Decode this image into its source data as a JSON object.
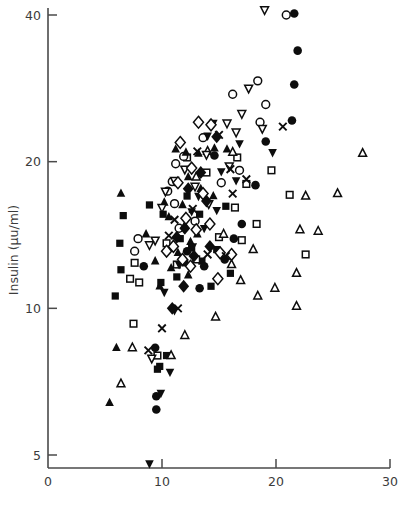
{
  "chart_data": {
    "type": "scatter",
    "title": "",
    "subtitle": "",
    "xlabel": "",
    "ylabel": "Insulin (μu/ml)",
    "xlim": [
      0,
      30
    ],
    "ylim": [
      4.3,
      44
    ],
    "yscale": "log",
    "xscale": "linear",
    "grid": false,
    "legend": "none",
    "xticks": [
      0,
      10,
      20,
      30
    ],
    "xtick_labels": [
      "0",
      "10",
      "20",
      "30"
    ],
    "yticks": [
      5,
      10,
      20,
      40
    ],
    "ytick_labels": [
      "5",
      "10",
      "20",
      "40"
    ],
    "marker_styles": [
      "filled-square",
      "open-square",
      "filled-circle",
      "open-circle",
      "filled-triangle-up",
      "open-triangle-up",
      "filled-triangle-down",
      "open-triangle-down",
      "filled-diamond",
      "open-diamond",
      "cross-x"
    ],
    "series": [
      {
        "name": "filled-square",
        "marker": "filled-square",
        "points": [
          [
            6.6,
            15.5
          ],
          [
            6.3,
            13.6
          ],
          [
            6.4,
            12.0
          ],
          [
            5.9,
            10.6
          ],
          [
            8.9,
            16.3
          ],
          [
            10.1,
            15.6
          ],
          [
            11.6,
            13.9
          ],
          [
            12.6,
            13.3
          ],
          [
            12.0,
            12.4
          ],
          [
            13.3,
            15.6
          ],
          [
            13.5,
            12.5
          ],
          [
            14.8,
            13.2
          ],
          [
            11.3,
            11.6
          ],
          [
            9.9,
            11.3
          ],
          [
            14.3,
            11.1
          ],
          [
            12.2,
            17.0
          ],
          [
            15.6,
            16.2
          ],
          [
            10.4,
            8.0
          ],
          [
            9.8,
            7.6
          ],
          [
            9.6,
            7.5
          ],
          [
            16.0,
            11.8
          ]
        ]
      },
      {
        "name": "open-square",
        "marker": "open-square",
        "points": [
          [
            7.6,
            12.4
          ],
          [
            7.2,
            11.5
          ],
          [
            8.0,
            11.3
          ],
          [
            10.4,
            13.6
          ],
          [
            11.3,
            12.3
          ],
          [
            13.0,
            12.6
          ],
          [
            15.0,
            14.0
          ],
          [
            16.4,
            16.1
          ],
          [
            17.0,
            13.8
          ],
          [
            18.3,
            14.9
          ],
          [
            17.4,
            18.0
          ],
          [
            16.6,
            20.4
          ],
          [
            21.2,
            17.1
          ],
          [
            22.6,
            12.9
          ],
          [
            7.5,
            9.3
          ],
          [
            9.6,
            8.0
          ],
          [
            13.9,
            19.0
          ],
          [
            12.2,
            20.4
          ],
          [
            19.6,
            19.2
          ]
        ]
      },
      {
        "name": "filled-circle",
        "marker": "filled-circle",
        "points": [
          [
            21.6,
            40.3
          ],
          [
            21.9,
            33.8
          ],
          [
            21.6,
            28.8
          ],
          [
            21.4,
            24.3
          ],
          [
            19.1,
            22.0
          ],
          [
            18.2,
            17.9
          ],
          [
            17.0,
            14.9
          ],
          [
            16.3,
            13.9
          ],
          [
            15.5,
            12.6
          ],
          [
            13.7,
            12.2
          ],
          [
            13.3,
            11.0
          ],
          [
            9.4,
            8.3
          ],
          [
            9.5,
            6.6
          ],
          [
            9.5,
            6.2
          ],
          [
            12.2,
            13.1
          ],
          [
            8.4,
            12.2
          ],
          [
            14.6,
            20.6
          ]
        ]
      },
      {
        "name": "open-circle",
        "marker": "open-circle",
        "points": [
          [
            20.9,
            40.0
          ],
          [
            18.4,
            29.3
          ],
          [
            16.2,
            27.5
          ],
          [
            19.1,
            26.2
          ],
          [
            18.6,
            24.1
          ],
          [
            13.6,
            22.4
          ],
          [
            11.9,
            20.5
          ],
          [
            11.2,
            19.8
          ],
          [
            10.9,
            18.2
          ],
          [
            10.5,
            17.4
          ],
          [
            11.1,
            16.4
          ],
          [
            7.9,
            13.9
          ],
          [
            7.6,
            13.1
          ],
          [
            15.2,
            18.1
          ],
          [
            16.8,
            19.2
          ],
          [
            11.5,
            14.6
          ],
          [
            12.9,
            15.1
          ]
        ]
      },
      {
        "name": "filled-triangle-up",
        "marker": "filled-triangle-up",
        "points": [
          [
            11.2,
            21.2
          ],
          [
            12.1,
            20.9
          ],
          [
            13.2,
            20.8
          ],
          [
            14.6,
            21.3
          ],
          [
            15.7,
            21.2
          ],
          [
            12.3,
            18.6
          ],
          [
            13.4,
            17.6
          ],
          [
            14.5,
            17.0
          ],
          [
            11.8,
            16.3
          ],
          [
            10.6,
            15.4
          ],
          [
            12.0,
            14.8
          ],
          [
            13.1,
            14.2
          ],
          [
            12.5,
            13.7
          ],
          [
            11.4,
            13.0
          ],
          [
            10.8,
            12.1
          ],
          [
            12.3,
            11.7
          ],
          [
            9.8,
            11.1
          ],
          [
            6.4,
            17.2
          ],
          [
            6.0,
            8.3
          ],
          [
            5.4,
            6.4
          ],
          [
            9.4,
            12.5
          ],
          [
            10.2,
            16.5
          ],
          [
            8.6,
            14.2
          ]
        ]
      },
      {
        "name": "open-triangle-up",
        "marker": "open-triangle-up",
        "points": [
          [
            13.0,
            18.6
          ],
          [
            14.0,
            21.0
          ],
          [
            16.2,
            20.9
          ],
          [
            15.4,
            14.2
          ],
          [
            16.9,
            11.4
          ],
          [
            18.4,
            10.6
          ],
          [
            19.9,
            11.0
          ],
          [
            21.8,
            11.8
          ],
          [
            22.1,
            14.5
          ],
          [
            23.7,
            14.4
          ],
          [
            25.4,
            17.2
          ],
          [
            27.6,
            20.8
          ],
          [
            22.6,
            17.0
          ],
          [
            18.0,
            13.2
          ],
          [
            16.1,
            12.3
          ],
          [
            14.7,
            9.6
          ],
          [
            12.0,
            8.8
          ],
          [
            10.8,
            8.0
          ],
          [
            7.4,
            8.3
          ],
          [
            6.4,
            7.0
          ],
          [
            21.8,
            10.1
          ]
        ]
      },
      {
        "name": "filled-triangle-down",
        "marker": "filled-triangle-down",
        "points": [
          [
            14.5,
            24.0
          ],
          [
            16.8,
            21.8
          ],
          [
            19.7,
            20.9
          ],
          [
            15.2,
            19.1
          ],
          [
            16.5,
            18.3
          ],
          [
            13.2,
            17.0
          ],
          [
            14.8,
            15.9
          ],
          [
            13.7,
            14.6
          ],
          [
            12.7,
            13.4
          ],
          [
            11.5,
            12.3
          ],
          [
            10.2,
            10.8
          ],
          [
            11.1,
            9.9
          ],
          [
            10.7,
            7.4
          ],
          [
            9.9,
            6.7
          ],
          [
            8.9,
            4.8
          ],
          [
            14.0,
            22.6
          ],
          [
            12.6,
            15.8
          ]
        ]
      },
      {
        "name": "open-triangle-down",
        "marker": "open-triangle-down",
        "points": [
          [
            19.0,
            41.0
          ],
          [
            17.6,
            28.3
          ],
          [
            18.8,
            23.4
          ],
          [
            15.7,
            24.0
          ],
          [
            16.5,
            23.0
          ],
          [
            13.9,
            20.7
          ],
          [
            12.0,
            19.3
          ],
          [
            11.1,
            18.3
          ],
          [
            10.3,
            17.4
          ],
          [
            12.9,
            17.8
          ],
          [
            14.1,
            16.4
          ],
          [
            10.0,
            16.1
          ],
          [
            15.9,
            19.6
          ],
          [
            9.4,
            13.8
          ],
          [
            8.9,
            13.5
          ],
          [
            9.1,
            7.9
          ],
          [
            17.0,
            25.1
          ]
        ]
      },
      {
        "name": "filled-diamond",
        "marker": "filled-diamond",
        "points": [
          [
            14.8,
            22.5
          ],
          [
            13.4,
            19.0
          ],
          [
            12.3,
            17.6
          ],
          [
            13.9,
            16.6
          ],
          [
            12.0,
            14.6
          ],
          [
            11.3,
            14.0
          ],
          [
            12.8,
            12.8
          ],
          [
            11.9,
            11.1
          ],
          [
            10.9,
            10.0
          ],
          [
            14.2,
            13.4
          ]
        ]
      },
      {
        "name": "open-diamond",
        "marker": "open-diamond",
        "points": [
          [
            13.2,
            24.1
          ],
          [
            14.3,
            23.8
          ],
          [
            11.6,
            21.9
          ],
          [
            12.6,
            19.4
          ],
          [
            11.4,
            18.1
          ],
          [
            13.6,
            17.2
          ],
          [
            12.1,
            15.3
          ],
          [
            13.0,
            14.5
          ],
          [
            14.2,
            14.9
          ],
          [
            11.0,
            13.4
          ],
          [
            12.5,
            12.2
          ],
          [
            10.4,
            13.1
          ],
          [
            15.1,
            13.0
          ],
          [
            16.1,
            12.9
          ],
          [
            14.9,
            11.5
          ],
          [
            11.8,
            12.6
          ]
        ]
      },
      {
        "name": "cross-x",
        "marker": "cross-x",
        "points": [
          [
            20.6,
            23.6
          ],
          [
            15.0,
            22.7
          ],
          [
            16.0,
            19.3
          ],
          [
            17.4,
            18.4
          ],
          [
            12.7,
            16.0
          ],
          [
            11.1,
            15.2
          ],
          [
            10.6,
            14.1
          ],
          [
            14.0,
            12.9
          ],
          [
            15.6,
            12.8
          ],
          [
            11.4,
            10.0
          ],
          [
            10.0,
            9.1
          ],
          [
            8.8,
            8.2
          ],
          [
            13.1,
            21.0
          ],
          [
            16.2,
            17.2
          ]
        ]
      }
    ]
  }
}
